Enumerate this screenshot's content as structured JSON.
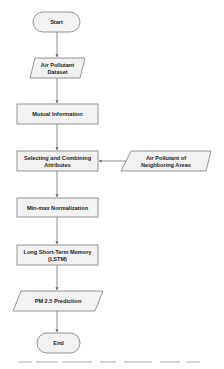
{
  "colors": {
    "node_fill": "#f2f2f2",
    "node_stroke": "#7a7a7a",
    "connector": "#6e6e6e",
    "text": "#222222",
    "background": "#ffffff"
  },
  "flowchart": {
    "nodes": [
      {
        "id": "start",
        "shape": "terminator",
        "label": "Start"
      },
      {
        "id": "dataset",
        "shape": "data",
        "lines": [
          "Air Pollutant",
          "Dataset"
        ]
      },
      {
        "id": "mutual",
        "shape": "process",
        "label": "Mutual Information"
      },
      {
        "id": "select",
        "shape": "process",
        "lines": [
          "Selecting and Combining",
          "Attributes"
        ]
      },
      {
        "id": "neighbor",
        "shape": "data",
        "lines": [
          "Air Pollutant of",
          "Neighboring Areas"
        ]
      },
      {
        "id": "minmax",
        "shape": "process",
        "label": "Min-max Normalization"
      },
      {
        "id": "lstm",
        "shape": "process",
        "lines": [
          "Long Short-Term Memory",
          "(LSTM)"
        ]
      },
      {
        "id": "pm25",
        "shape": "data",
        "label": "PM 2.5 Prediction"
      },
      {
        "id": "end",
        "shape": "terminator",
        "label": "End"
      }
    ],
    "edges": [
      [
        "start",
        "dataset"
      ],
      [
        "dataset",
        "mutual"
      ],
      [
        "mutual",
        "select"
      ],
      [
        "neighbor",
        "select"
      ],
      [
        "select",
        "minmax"
      ],
      [
        "minmax",
        "lstm"
      ],
      [
        "lstm",
        "pm25"
      ],
      [
        "pm25",
        "end"
      ]
    ]
  }
}
